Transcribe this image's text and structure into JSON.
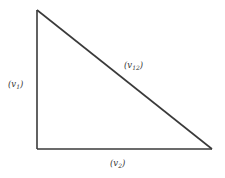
{
  "diagram": {
    "type": "right-triangle",
    "colors": {
      "stroke": "#3a3a3a",
      "text": "#333333",
      "background": "#ffffff"
    },
    "vertices": {
      "top": [
        37,
        10
      ],
      "bottom_left": [
        37,
        149
      ],
      "bottom_right": [
        212,
        149
      ]
    },
    "edges": [
      {
        "id": "v1",
        "label": "(v₁)",
        "base": "v",
        "subscript": "1",
        "position": "left"
      },
      {
        "id": "v2",
        "label": "(v₂)",
        "base": "v",
        "subscript": "2",
        "position": "bottom"
      },
      {
        "id": "v12",
        "label": "(v₁₂)",
        "base": "v",
        "subscript": "12",
        "position": "hypotenuse"
      }
    ]
  }
}
